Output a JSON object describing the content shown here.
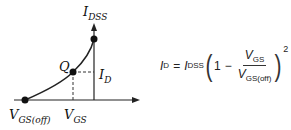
{
  "diagram": {
    "type": "jfet-transfer-characteristic",
    "labels": {
      "idss": {
        "main": "I",
        "sub": "DSS"
      },
      "q": "Q",
      "id": {
        "main": "I",
        "sub": "D"
      },
      "vgsoff": {
        "main": "V",
        "sub": "GS(off)"
      },
      "vgs": {
        "main": "V",
        "sub": "GS"
      }
    },
    "points": [
      {
        "name": "V_GS(off)",
        "x": 25,
        "y": 100
      },
      {
        "name": "Q",
        "x": 73,
        "y": 72
      },
      {
        "name": "I_DSS",
        "x": 94,
        "y": 39
      }
    ],
    "colors": {
      "line": "#222222",
      "point": "#111111"
    }
  },
  "equation": {
    "lhs_main": "I",
    "lhs_sub": "D",
    "eq": "=",
    "idss_main": "I",
    "idss_sub": "DSS",
    "one": "1",
    "minus": "−",
    "num_main": "V",
    "num_sub": "GS",
    "den_main": "V",
    "den_sub": "GS(off)",
    "exponent": "2"
  }
}
